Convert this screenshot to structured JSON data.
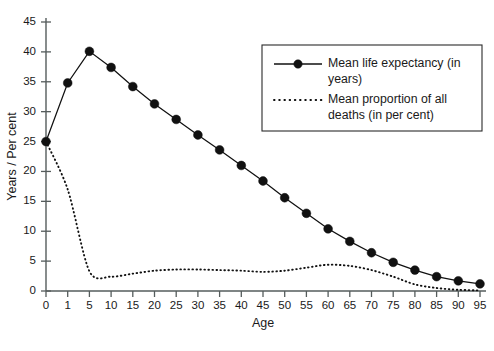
{
  "chart_data": {
    "type": "line",
    "title": "",
    "xlabel": "Age",
    "ylabel": "Years / Per cent",
    "xlim": [
      0,
      95
    ],
    "ylim": [
      0,
      45
    ],
    "grid": false,
    "legend_position": "top-right",
    "x_tick_labels": [
      "0",
      "1",
      "5",
      "10",
      "15",
      "20",
      "25",
      "30",
      "35",
      "40",
      "45",
      "50",
      "55",
      "60",
      "65",
      "70",
      "75",
      "80",
      "85",
      "90",
      "95"
    ],
    "y_tick_labels": [
      "0",
      "5",
      "10",
      "15",
      "20",
      "25",
      "30",
      "35",
      "40",
      "45"
    ],
    "x": [
      0,
      1,
      5,
      10,
      15,
      20,
      25,
      30,
      35,
      40,
      45,
      50,
      55,
      60,
      65,
      70,
      75,
      80,
      85,
      90,
      95
    ],
    "series": [
      {
        "name": "Mean life expectancy (in years)",
        "style": "solid-with-markers",
        "color": "#111111",
        "values": [
          25.0,
          34.8,
          40.1,
          37.4,
          34.2,
          31.3,
          28.7,
          26.1,
          23.6,
          21.0,
          18.4,
          15.6,
          13.0,
          10.4,
          8.3,
          6.4,
          4.8,
          3.5,
          2.4,
          1.7,
          1.2
        ]
      },
      {
        "name": "Mean proportion of all deaths (in per cent)",
        "style": "dotted",
        "color": "#111111",
        "values": [
          25.0,
          17.0,
          3.3,
          2.4,
          2.9,
          3.4,
          3.6,
          3.6,
          3.5,
          3.4,
          3.2,
          3.4,
          3.9,
          4.4,
          4.2,
          3.5,
          2.4,
          1.1,
          0.5,
          0.2,
          0.1
        ]
      }
    ],
    "legend": [
      {
        "label": "Mean life expectancy (in years)",
        "style": "solid-with-markers"
      },
      {
        "label": "Mean proportion of all deaths (in per cent)",
        "style": "dotted"
      }
    ]
  }
}
